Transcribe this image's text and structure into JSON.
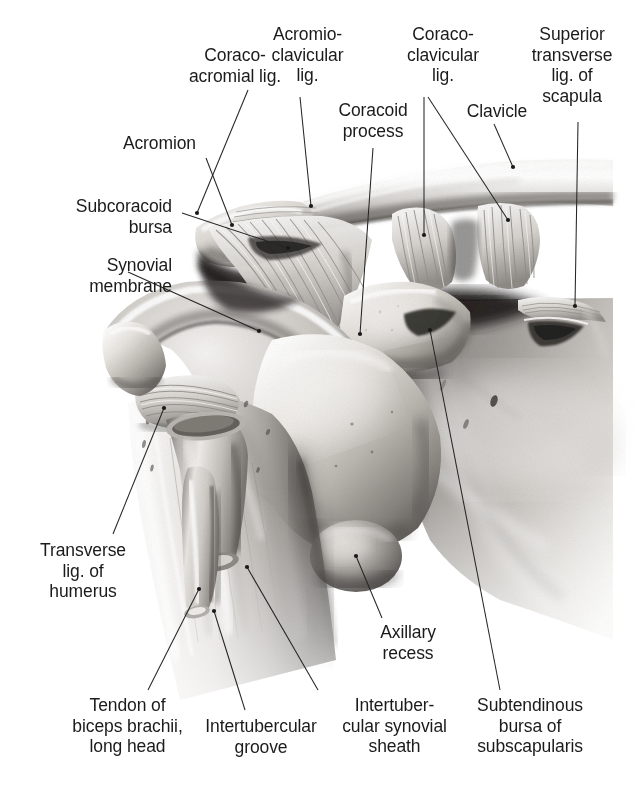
{
  "figure": {
    "view": "anterior",
    "rendering": "grayscale-airbrush-anatomical-illustration",
    "background_color": "#ffffff",
    "ink_color": "#1b1b1b",
    "leader_color": "#262626"
  },
  "labels": [
    {
      "id": "coraco-acromial-lig",
      "lines": [
        "Coraco-",
        "acromial lig."
      ],
      "text": "Coraco-\nacromial lig.",
      "align": "center",
      "x": 155,
      "y": 45,
      "w": 160,
      "leaders": [
        {
          "x1": 248,
          "y1": 90,
          "x2": 197,
          "y2": 213
        }
      ]
    },
    {
      "id": "acromio-clavicular-lig",
      "lines": [
        "Acromio-",
        "clavicular",
        "lig."
      ],
      "text": "Acromio-\nclavicular\nlig.",
      "align": "center",
      "x": 245,
      "y": 24,
      "w": 125,
      "leaders": [
        {
          "x1": 300,
          "y1": 97,
          "x2": 311,
          "y2": 206
        }
      ]
    },
    {
      "id": "coracoid-process",
      "lines": [
        "Coracoid",
        "process"
      ],
      "text": "Coracoid\nprocess",
      "align": "center",
      "x": 318,
      "y": 100,
      "w": 110,
      "leaders": [
        {
          "x1": 373,
          "y1": 148,
          "x2": 360,
          "y2": 334
        }
      ]
    },
    {
      "id": "coraco-clavicular-lig",
      "lines": [
        "Coraco-",
        "clavicular",
        "lig."
      ],
      "text": "Coraco-\nclavicular\nlig.",
      "align": "center",
      "x": 383,
      "y": 24,
      "w": 120,
      "leaders": [
        {
          "x1": 424,
          "y1": 97,
          "x2": 424,
          "y2": 235
        },
        {
          "x1": 428,
          "y1": 97,
          "x2": 508,
          "y2": 220
        }
      ]
    },
    {
      "id": "clavicle",
      "lines": [
        "Clavicle"
      ],
      "text": "Clavicle",
      "align": "center",
      "x": 452,
      "y": 101,
      "w": 90,
      "leaders": [
        {
          "x1": 494,
          "y1": 124,
          "x2": 513,
          "y2": 167
        }
      ]
    },
    {
      "id": "superior-transverse-lig-of-scapula",
      "lines": [
        "Superior",
        "transverse",
        "lig. of",
        "scapula"
      ],
      "text": "Superior\ntransverse\nlig. of\nscapula",
      "align": "center",
      "x": 512,
      "y": 24,
      "w": 120,
      "leaders": [
        {
          "x1": 578,
          "y1": 122,
          "x2": 575,
          "y2": 306
        }
      ]
    },
    {
      "id": "acromion",
      "lines": [
        "Acromion"
      ],
      "text": "Acromion",
      "align": "right",
      "x": 52,
      "y": 133,
      "w": 144,
      "leaders": [
        {
          "x1": 206,
          "y1": 158,
          "x2": 232,
          "y2": 225
        }
      ]
    },
    {
      "id": "subcoracoid-bursa",
      "lines": [
        "Subcoracoid",
        "bursa"
      ],
      "text": "Subcoracoid\nbursa",
      "align": "right",
      "x": 20,
      "y": 196,
      "w": 152,
      "leaders": [
        {
          "x1": 182,
          "y1": 213,
          "x2": 288,
          "y2": 248
        }
      ]
    },
    {
      "id": "synovial-membrane",
      "lines": [
        "Synovial",
        "membrane"
      ],
      "text": "Synovial\nmembrane",
      "align": "right",
      "x": 18,
      "y": 255,
      "w": 154,
      "leaders": [
        {
          "x1": 128,
          "y1": 272,
          "x2": 259,
          "y2": 331
        }
      ]
    },
    {
      "id": "transverse-lig-of-humerus",
      "lines": [
        "Transverse",
        "lig. of",
        "humerus"
      ],
      "text": "Transverse\nlig. of\nhumerus",
      "align": "center",
      "x": 18,
      "y": 540,
      "w": 130,
      "leaders": [
        {
          "x1": 113,
          "y1": 534,
          "x2": 164,
          "y2": 408
        }
      ]
    },
    {
      "id": "tendon-of-biceps-brachii-long-head",
      "lines": [
        "Tendon of",
        "biceps brachii,",
        "long head"
      ],
      "text": "Tendon of\nbiceps brachii,\nlong head",
      "align": "center",
      "x": 55,
      "y": 695,
      "w": 145,
      "leaders": [
        {
          "x1": 148,
          "y1": 690,
          "x2": 199,
          "y2": 589
        }
      ]
    },
    {
      "id": "intertubercular-groove",
      "lines": [
        "Intertubercular",
        "groove"
      ],
      "text": "Intertubercular\ngroove",
      "align": "center",
      "x": 196,
      "y": 716,
      "w": 130,
      "leaders": [
        {
          "x1": 245,
          "y1": 710,
          "x2": 214,
          "y2": 611
        }
      ]
    },
    {
      "id": "intertubercular-synovial-sheath",
      "lines": [
        "Intertuber-",
        "cular synovial",
        "sheath"
      ],
      "text": "Intertuber-\ncular synovial\nsheath",
      "align": "center",
      "x": 327,
      "y": 695,
      "w": 135,
      "leaders": [
        {
          "x1": 318,
          "y1": 690,
          "x2": 247,
          "y2": 567
        }
      ]
    },
    {
      "id": "axillary-recess",
      "lines": [
        "Axillary",
        "recess"
      ],
      "text": "Axillary\nrecess",
      "align": "center",
      "x": 358,
      "y": 622,
      "w": 100,
      "leaders": [
        {
          "x1": 382,
          "y1": 618,
          "x2": 356,
          "y2": 556
        }
      ]
    },
    {
      "id": "subtendinous-bursa-of-subscapularis",
      "lines": [
        "Subtendinous",
        "bursa of",
        "subscapularis"
      ],
      "text": "Subtendinous\nbursa of\nsubscapularis",
      "align": "center",
      "x": 450,
      "y": 695,
      "w": 160,
      "leaders": [
        {
          "x1": 500,
          "y1": 690,
          "x2": 430,
          "y2": 330
        }
      ]
    }
  ]
}
